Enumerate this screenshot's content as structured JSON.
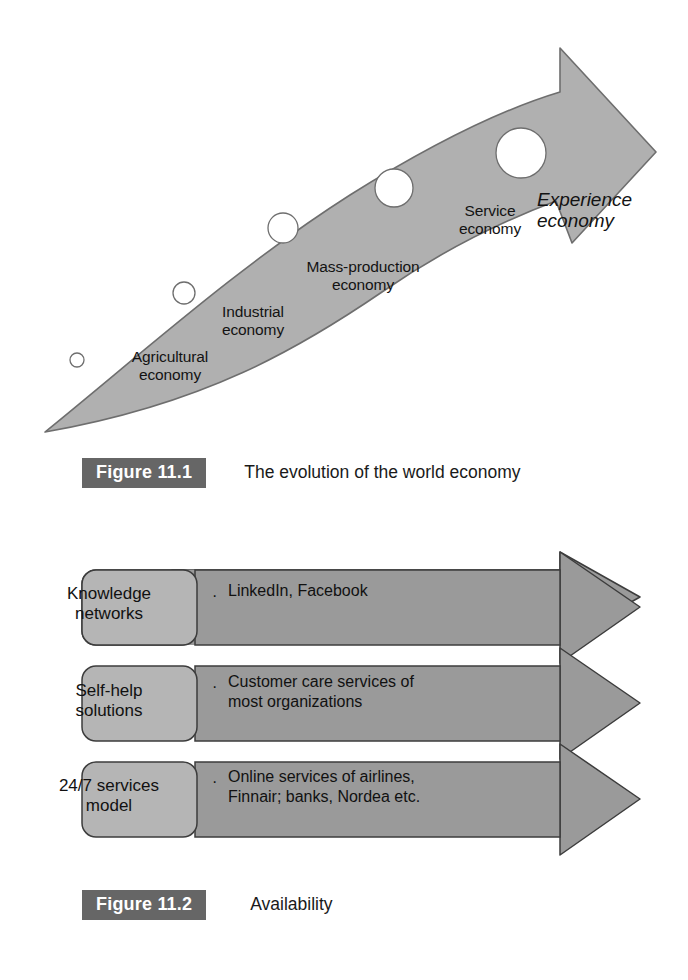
{
  "page": {
    "background": "#ffffff",
    "width": 688,
    "height": 980
  },
  "figure1": {
    "id": "Figure 11.1",
    "caption": "The evolution of the world economy",
    "diagram_type": "curved-arrow-timeline",
    "arrow_fill": "#b0b0b0",
    "arrow_stroke": "#6e6e6e",
    "stages": [
      {
        "label": "Agricultural\neconomy",
        "marker": "circle",
        "marker_size": "xs"
      },
      {
        "label": "Industrial\neconomy",
        "marker": "circle",
        "marker_size": "s"
      },
      {
        "label": "Mass-production\neconomy",
        "marker": "circle",
        "marker_size": "m"
      },
      {
        "label": "Service\neconomy",
        "marker": "circle",
        "marker_size": "l"
      },
      {
        "label": "Experience\neconomy",
        "marker": "circle",
        "marker_size": "xl",
        "style": "italic"
      }
    ]
  },
  "figure2": {
    "id": "Figure 11.2",
    "caption": "Availability",
    "diagram_type": "stacked-arrow-rows",
    "box_fill": "#b5b5b5",
    "arrow_fill": "#9a9a9a",
    "stroke": "#3c3c3c",
    "bullet_glyph": "·",
    "rows": [
      {
        "title": "Knowledge\nnetworks",
        "body": "LinkedIn, Facebook"
      },
      {
        "title": "Self-help\nsolutions",
        "body": "Customer care services of\nmost organizations"
      },
      {
        "title": "24/7 services\nmodel",
        "body": "Online services of airlines,\nFinnair; banks, Nordea etc."
      }
    ]
  }
}
